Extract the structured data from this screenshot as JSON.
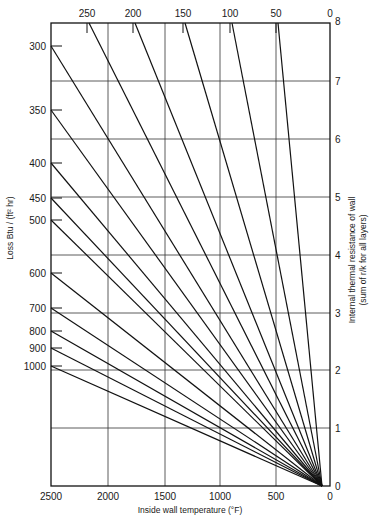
{
  "chart_data": {
    "type": "line",
    "title": "",
    "subtitle": "Nomograph: heat loss vs inside wall temperature and internal thermal resistance",
    "xlabel": "Inside wall temperature (°F)",
    "ylabel": "Loss Btu / (ft² hr)",
    "y2label": "Internal thermal resistance of wall",
    "y2label_sub": "(sum of r/k  for all layers)",
    "x_ticks": [
      "2500",
      "2000",
      "1500",
      "1000",
      "500",
      "0"
    ],
    "xlim": [
      2500,
      0
    ],
    "y2_ticks": [
      "0",
      "1",
      "2",
      "3",
      "4",
      "5",
      "6",
      "7",
      "8"
    ],
    "y2lim": [
      0,
      8
    ],
    "top_ticks": [
      "250",
      "200",
      "150",
      "100",
      "50",
      "0"
    ],
    "left_ticks": [
      "300",
      "350",
      "400",
      "450",
      "500",
      "600",
      "700",
      "800",
      "900",
      "1000"
    ],
    "grid": true,
    "legend": "none",
    "series": [
      {
        "name": "250",
        "start_axis": "top",
        "convergence_temp_F": 70
      },
      {
        "name": "200",
        "start_axis": "top",
        "convergence_temp_F": 70
      },
      {
        "name": "150",
        "start_axis": "top",
        "convergence_temp_F": 70
      },
      {
        "name": "100",
        "start_axis": "top",
        "convergence_temp_F": 70
      },
      {
        "name": "50",
        "start_axis": "top",
        "convergence_temp_F": 70
      },
      {
        "name": "300",
        "start_axis": "left",
        "start_resistance": 7.6,
        "convergence_temp_F": 70
      },
      {
        "name": "350",
        "start_axis": "left",
        "start_resistance": 6.5,
        "convergence_temp_F": 70
      },
      {
        "name": "400",
        "start_axis": "left",
        "start_resistance": 5.6,
        "convergence_temp_F": 70
      },
      {
        "name": "450",
        "start_axis": "left",
        "start_resistance": 5.0,
        "convergence_temp_F": 70
      },
      {
        "name": "500",
        "start_axis": "left",
        "start_resistance": 4.6,
        "convergence_temp_F": 70
      },
      {
        "name": "600",
        "start_axis": "left",
        "start_resistance": 3.7,
        "convergence_temp_F": 70
      },
      {
        "name": "700",
        "start_axis": "left",
        "start_resistance": 3.1,
        "convergence_temp_F": 70
      },
      {
        "name": "800",
        "start_axis": "left",
        "start_resistance": 2.7,
        "convergence_temp_F": 70
      },
      {
        "name": "900",
        "start_axis": "left",
        "start_resistance": 2.4,
        "convergence_temp_F": 70
      },
      {
        "name": "1000",
        "start_axis": "left",
        "start_resistance": 2.1,
        "convergence_temp_F": 70
      }
    ]
  },
  "layout": {
    "plot": {
      "left": 51,
      "right": 330,
      "top": 23,
      "bottom": 486
    },
    "converge": {
      "x": 322,
      "y": 486
    },
    "x_tick_px": [
      51,
      108,
      165,
      220,
      276,
      330
    ],
    "y2_tick_px": [
      486,
      428,
      370,
      313,
      255,
      197,
      139,
      81,
      23
    ],
    "top_tick_px": [
      87,
      133,
      183,
      230,
      276,
      330
    ],
    "left_tick_px": [
      46,
      110,
      163,
      198,
      220,
      273,
      308,
      331,
      348,
      366
    ]
  }
}
